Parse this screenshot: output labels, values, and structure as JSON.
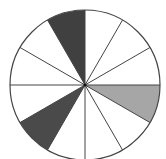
{
  "diagram": {
    "type": "fraction-circle",
    "total_sectors": 12,
    "center": [
      85,
      85
    ],
    "radius": 75,
    "stroke_color": "#444444",
    "background": "#ffffff",
    "shaded_sectors": [
      {
        "start_deg": 240,
        "end_deg": 270,
        "color": "#404040",
        "label": "dark-top"
      },
      {
        "start_deg": 0,
        "end_deg": 30,
        "color": "#a6a6a6",
        "label": "light-gray-right"
      },
      {
        "start_deg": 120,
        "end_deg": 150,
        "color": "#4a4a4a",
        "label": "dark-lower-left"
      }
    ]
  }
}
